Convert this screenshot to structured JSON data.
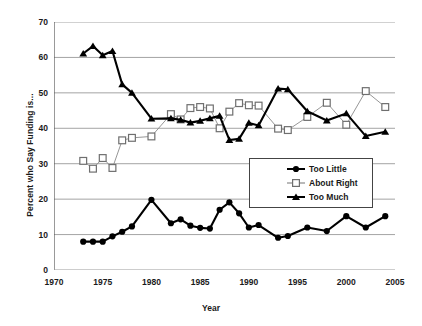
{
  "chart_data": {
    "type": "line",
    "title": "",
    "xlabel": "Year",
    "ylabel": "Percent who Say Funding is...",
    "xlim": [
      1970,
      2005
    ],
    "ylim": [
      0,
      70
    ],
    "xticks": [
      1970,
      1975,
      1980,
      1985,
      1990,
      1995,
      2000,
      2005
    ],
    "yticks": [
      0,
      10,
      20,
      30,
      40,
      50,
      60,
      70
    ],
    "grid": "horizontal",
    "legend_position": "inside-right-middle",
    "series": [
      {
        "name": "Too Little",
        "marker": "filled-circle",
        "color": "#000000",
        "x": [
          1973,
          1974,
          1975,
          1976,
          1977,
          1978,
          1980,
          1982,
          1983,
          1984,
          1985,
          1986,
          1987,
          1988,
          1989,
          1990,
          1991,
          1993,
          1994,
          1996,
          1998,
          2000,
          2002,
          2004
        ],
        "values": [
          8,
          8,
          8,
          9.5,
          10.8,
          12.3,
          19.8,
          13.2,
          14.3,
          12.5,
          11.9,
          11.7,
          17,
          19.1,
          16,
          12,
          12.7,
          9.1,
          9.6,
          12,
          11,
          15.2,
          12,
          15.2
        ]
      },
      {
        "name": "About Right",
        "marker": "open-square",
        "color": "#808080",
        "x": [
          1973,
          1974,
          1975,
          1976,
          1977,
          1978,
          1980,
          1982,
          1983,
          1984,
          1985,
          1986,
          1987,
          1988,
          1989,
          1990,
          1991,
          1993,
          1994,
          1996,
          1998,
          2000,
          2002,
          2004
        ],
        "values": [
          30.8,
          28.6,
          31.6,
          28.8,
          36.6,
          37.3,
          37.7,
          44,
          42.5,
          45.7,
          46,
          45.6,
          40,
          44.7,
          47.1,
          46.5,
          46.4,
          39.9,
          39.5,
          43.2,
          47.2,
          41,
          50.5,
          46
        ]
      },
      {
        "name": "Too Much",
        "marker": "filled-triangle",
        "color": "#000000",
        "x": [
          1973,
          1974,
          1975,
          1976,
          1977,
          1978,
          1980,
          1982,
          1983,
          1984,
          1985,
          1986,
          1987,
          1988,
          1989,
          1990,
          1991,
          1993,
          1994,
          1996,
          1998,
          2000,
          2002,
          2004
        ],
        "values": [
          61.1,
          63.2,
          60.6,
          61.8,
          52.4,
          50,
          42.7,
          42.8,
          42.4,
          41.6,
          42.1,
          42.8,
          43.5,
          36.7,
          37,
          41.5,
          40.8,
          51.2,
          51,
          44.8,
          42.2,
          44.2,
          37.8,
          39
        ]
      }
    ]
  }
}
